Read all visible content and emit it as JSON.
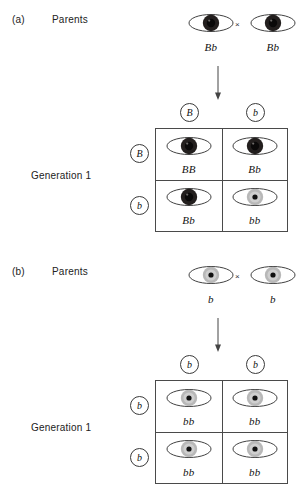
{
  "figure": {
    "type": "punnett-square-genetics-diagram",
    "trait": "eye colour",
    "alleles": {
      "dominant": "B",
      "recessive": "b"
    }
  },
  "colors": {
    "outline": "#3a3a3a",
    "grid_border": "#4a4a4a",
    "brown_iris": "#231f1e",
    "brown_pupil": "#0a0909",
    "blue_iris": "#b8b8b8",
    "blue_pupil": "#111111",
    "sclera": "#ffffff",
    "text": "#1a1a1a"
  },
  "panels": [
    {
      "tag": "(a)",
      "parents_label": "Parents",
      "generation_label": "Generation 1",
      "cross_symbol": "×",
      "arrow": "down-arrow",
      "parents": [
        {
          "genotype": "Bb",
          "phenotype": "brown"
        },
        {
          "genotype": "Bb",
          "phenotype": "brown"
        }
      ],
      "gametes_top": [
        {
          "allele": "B"
        },
        {
          "allele": "b"
        }
      ],
      "gametes_left": [
        {
          "allele": "B"
        },
        {
          "allele": "b"
        }
      ],
      "offspring": [
        {
          "genotype": "BB",
          "phenotype": "brown"
        },
        {
          "genotype": "Bb",
          "phenotype": "brown"
        },
        {
          "genotype": "Bb",
          "phenotype": "brown"
        },
        {
          "genotype": "bb",
          "phenotype": "blue"
        }
      ]
    },
    {
      "tag": "(b)",
      "parents_label": "Parents",
      "generation_label": "Generation 1",
      "cross_symbol": "×",
      "arrow": "down-arrow",
      "parents": [
        {
          "genotype": "b",
          "phenotype": "blue"
        },
        {
          "genotype": "b",
          "phenotype": "blue"
        }
      ],
      "gametes_top": [
        {
          "allele": "b"
        },
        {
          "allele": "b"
        }
      ],
      "gametes_left": [
        {
          "allele": "b"
        },
        {
          "allele": "b"
        }
      ],
      "offspring": [
        {
          "genotype": "bb",
          "phenotype": "blue"
        },
        {
          "genotype": "bb",
          "phenotype": "blue"
        },
        {
          "genotype": "bb",
          "phenotype": "blue"
        },
        {
          "genotype": "bb",
          "phenotype": "blue"
        }
      ]
    }
  ]
}
